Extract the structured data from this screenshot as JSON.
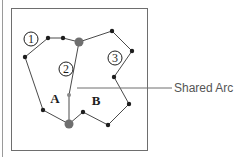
{
  "diagram": {
    "frame": {
      "x": 11,
      "y": 8,
      "width": 136,
      "height": 142,
      "stroke": "#6e6e6e"
    },
    "arcs": [
      {
        "id": "1",
        "label": "1",
        "points": [
          [
            69,
            124
          ],
          [
            43,
            110
          ],
          [
            25,
            57
          ],
          [
            48,
            38
          ],
          [
            63,
            38
          ],
          [
            79,
            42
          ]
        ]
      },
      {
        "id": "2",
        "label": "2",
        "points": [
          [
            79,
            42
          ],
          [
            69,
            95
          ],
          [
            69,
            124
          ]
        ],
        "shared": true
      },
      {
        "id": "3",
        "label": "3",
        "points": [
          [
            79,
            42
          ],
          [
            112,
            31
          ],
          [
            132,
            51
          ],
          [
            114,
            77
          ],
          [
            129,
            104
          ],
          [
            108,
            125
          ],
          [
            83,
            112
          ],
          [
            69,
            124
          ]
        ]
      }
    ],
    "nodes": [
      [
        79,
        42
      ],
      [
        69,
        124
      ]
    ],
    "vertices": [
      [
        43,
        110
      ],
      [
        25,
        57
      ],
      [
        48,
        38
      ],
      [
        63,
        38
      ],
      [
        112,
        31
      ],
      [
        132,
        51
      ],
      [
        114,
        77
      ],
      [
        129,
        104
      ],
      [
        108,
        125
      ],
      [
        83,
        112
      ]
    ],
    "shared_vertex": [
      69,
      95
    ],
    "arc_labels": [
      {
        "text": "1",
        "x": 31,
        "y": 39
      },
      {
        "text": "2",
        "x": 66,
        "y": 69
      },
      {
        "text": "3",
        "x": 115,
        "y": 58
      }
    ],
    "polygon_labels": [
      {
        "text": "A",
        "x": 55,
        "y": 98
      },
      {
        "text": "B",
        "x": 96,
        "y": 100
      }
    ],
    "callout": {
      "text": "Shared Arc",
      "line": [
        [
          77,
          88
        ],
        [
          172,
          88
        ]
      ]
    },
    "colors": {
      "line": "#4a4a4a",
      "vertex": "#1e1e1e",
      "node": "#6f6f6f",
      "shared_vertex": "#8a8a8a",
      "text": "#1e1e1e",
      "callout_text": "#555555"
    }
  }
}
